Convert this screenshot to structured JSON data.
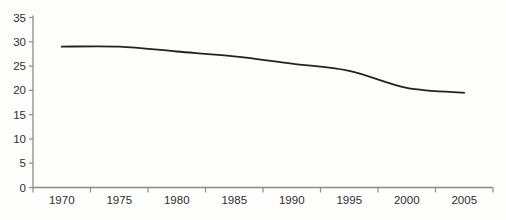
{
  "chart_data": {
    "type": "line",
    "title": "",
    "xlabel": "",
    "ylabel": "",
    "categories": [
      "1970",
      "1975",
      "1980",
      "1985",
      "1990",
      "1995",
      "2000",
      "2005"
    ],
    "series": [
      {
        "name": "series-1",
        "values": [
          29,
          29,
          28,
          27,
          25.5,
          24,
          20.5,
          19.5
        ]
      }
    ],
    "ylim": [
      0,
      35
    ],
    "yticks": [
      0,
      5,
      10,
      15,
      20,
      25,
      30,
      35
    ],
    "grid": false,
    "legend_position": "none",
    "smoothed_line": true,
    "colors": {
      "line": "#222222",
      "axis": "#8c8c8c",
      "tick": "#8c8c8c",
      "label_text": "#2e2e2e",
      "background": "#fdfdfc"
    },
    "layout": {
      "plot_left": 33,
      "plot_right": 493,
      "plot_bottom": 187.5,
      "plot_top": 17.5,
      "font_size": 11.5
    }
  }
}
